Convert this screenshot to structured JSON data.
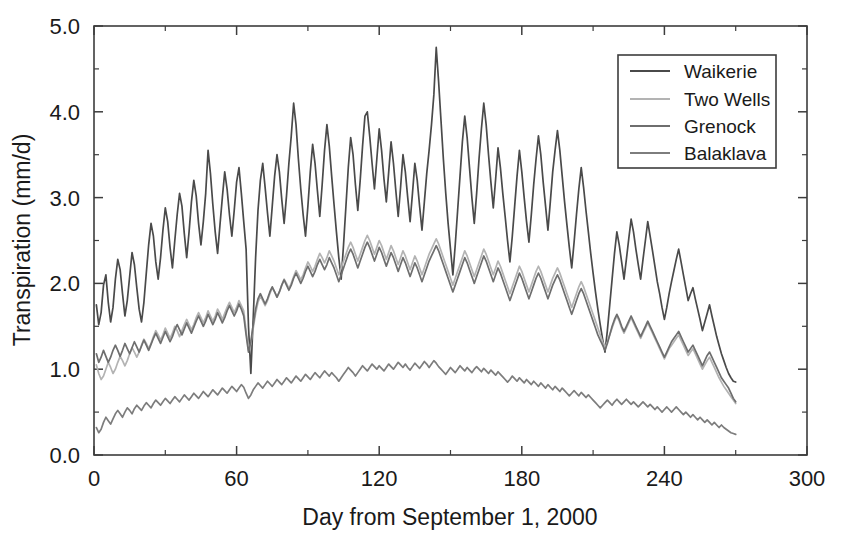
{
  "chart_data": {
    "type": "line",
    "title": "",
    "xlabel": "Day from September 1, 2000",
    "ylabel": "Transpiration (mm/d)",
    "xlim": [
      0,
      300
    ],
    "ylim": [
      0,
      5.0
    ],
    "x_major_ticks": [
      0,
      60,
      120,
      180,
      240,
      300
    ],
    "x_tick_labels": [
      "0",
      "60",
      "120",
      "180",
      "240",
      "300"
    ],
    "x_minor_interval": 30,
    "y_major_ticks": [
      0.0,
      1.0,
      2.0,
      3.0,
      4.0,
      5.0
    ],
    "y_tick_labels": [
      "0.0",
      "1.0",
      "2.0",
      "3.0",
      "4.0",
      "5.0"
    ],
    "y_minor_interval": 0.5,
    "grid": false,
    "legend_position": "top-right",
    "legend_entries": [
      "Waikerie",
      "Two Wells",
      "Grenock",
      "Balaklava"
    ],
    "x_start": 1,
    "x_end": 270,
    "x_step": 1,
    "series": [
      {
        "name": "Waikerie",
        "color": "#4a4a4a",
        "values": [
          1.75,
          1.52,
          1.66,
          1.98,
          2.1,
          1.78,
          1.55,
          1.72,
          2.05,
          2.28,
          2.16,
          1.88,
          1.62,
          1.8,
          2.08,
          2.36,
          2.22,
          1.95,
          1.7,
          1.55,
          1.78,
          2.12,
          2.45,
          2.7,
          2.55,
          2.25,
          2.05,
          2.3,
          2.62,
          2.88,
          2.72,
          2.42,
          2.18,
          2.5,
          2.8,
          3.05,
          2.9,
          2.58,
          2.3,
          2.6,
          2.95,
          3.2,
          3.02,
          2.7,
          2.45,
          2.72,
          3.05,
          3.55,
          3.28,
          2.92,
          2.6,
          2.35,
          2.68,
          3.0,
          3.3,
          3.1,
          2.8,
          2.55,
          2.85,
          3.18,
          3.35,
          3.05,
          2.72,
          2.4,
          1.5,
          0.95,
          1.6,
          2.3,
          2.85,
          3.2,
          3.4,
          3.12,
          2.82,
          2.55,
          2.9,
          3.25,
          3.5,
          3.3,
          2.98,
          2.7,
          3.02,
          3.4,
          3.72,
          4.1,
          3.85,
          3.45,
          3.1,
          2.8,
          2.55,
          2.9,
          3.3,
          3.62,
          3.4,
          3.08,
          2.78,
          3.15,
          3.55,
          3.85,
          3.6,
          3.25,
          2.92,
          2.6,
          2.3,
          2.05,
          2.45,
          2.9,
          3.35,
          3.7,
          3.5,
          3.15,
          2.85,
          3.2,
          3.6,
          3.95,
          4.0,
          3.72,
          3.4,
          3.1,
          3.45,
          3.8,
          3.55,
          3.22,
          2.95,
          3.3,
          3.65,
          3.4,
          3.08,
          2.78,
          3.12,
          3.5,
          3.3,
          3.0,
          2.72,
          3.05,
          3.4,
          3.2,
          2.9,
          2.62,
          2.95,
          3.28,
          3.55,
          3.85,
          4.2,
          4.75,
          4.35,
          3.9,
          3.45,
          3.05,
          2.7,
          2.4,
          2.1,
          2.45,
          2.85,
          3.25,
          3.65,
          3.95,
          3.7,
          3.35,
          3.0,
          2.7,
          3.05,
          3.45,
          3.8,
          4.1,
          3.85,
          3.5,
          3.18,
          2.88,
          3.22,
          3.58,
          3.35,
          3.05,
          2.78,
          2.5,
          2.25,
          2.55,
          2.9,
          3.25,
          3.55,
          3.3,
          3.0,
          2.72,
          2.48,
          2.8,
          3.15,
          3.45,
          3.72,
          3.5,
          3.18,
          2.9,
          2.62,
          2.95,
          3.3,
          3.55,
          3.78,
          3.55,
          3.25,
          2.95,
          2.68,
          2.42,
          2.18,
          2.48,
          2.8,
          3.1,
          3.35,
          3.12,
          2.85,
          2.6,
          2.35,
          2.12,
          1.9,
          1.7,
          1.52,
          1.35,
          1.2,
          1.45,
          1.75,
          2.05,
          2.35,
          2.6,
          2.45,
          2.25,
          2.05,
          2.28,
          2.52,
          2.75,
          2.6,
          2.4,
          2.22,
          2.05,
          2.28,
          2.5,
          2.72,
          2.55,
          2.38,
          2.2,
          2.02,
          1.88,
          1.72,
          1.58,
          1.72,
          1.88,
          2.02,
          2.15,
          2.28,
          2.4,
          2.25,
          2.1,
          1.95,
          1.8,
          1.88,
          1.95,
          1.82,
          1.7,
          1.58,
          1.45,
          1.55,
          1.65,
          1.75,
          1.62,
          1.5,
          1.38,
          1.28,
          1.18,
          1.1,
          1.02,
          0.95,
          0.9,
          0.86,
          0.85
        ]
      },
      {
        "name": "Two Wells",
        "color": "#b3b3b3",
        "values": [
          1.05,
          0.95,
          0.88,
          0.92,
          1.0,
          1.08,
          1.02,
          0.95,
          1.0,
          1.08,
          1.15,
          1.1,
          1.04,
          1.1,
          1.18,
          1.25,
          1.2,
          1.14,
          1.2,
          1.28,
          1.35,
          1.3,
          1.24,
          1.3,
          1.38,
          1.45,
          1.4,
          1.34,
          1.4,
          1.48,
          1.42,
          1.36,
          1.42,
          1.5,
          1.45,
          1.38,
          1.45,
          1.52,
          1.58,
          1.52,
          1.46,
          1.52,
          1.6,
          1.66,
          1.6,
          1.54,
          1.6,
          1.68,
          1.62,
          1.56,
          1.62,
          1.7,
          1.65,
          1.58,
          1.65,
          1.72,
          1.78,
          1.72,
          1.66,
          1.72,
          1.8,
          1.74,
          1.68,
          1.45,
          1.22,
          1.3,
          1.48,
          1.65,
          1.78,
          1.85,
          1.8,
          1.74,
          1.8,
          1.88,
          1.95,
          1.9,
          1.84,
          1.9,
          1.98,
          2.05,
          2.0,
          1.94,
          2.0,
          2.08,
          2.15,
          2.1,
          2.04,
          2.1,
          2.18,
          2.25,
          2.2,
          2.14,
          2.2,
          2.28,
          2.35,
          2.3,
          2.24,
          2.3,
          2.38,
          2.32,
          2.26,
          2.18,
          2.1,
          2.18,
          2.26,
          2.34,
          2.42,
          2.48,
          2.42,
          2.34,
          2.26,
          2.34,
          2.42,
          2.5,
          2.56,
          2.5,
          2.42,
          2.34,
          2.42,
          2.5,
          2.44,
          2.36,
          2.28,
          2.36,
          2.44,
          2.38,
          2.3,
          2.22,
          2.3,
          2.38,
          2.32,
          2.24,
          2.16,
          2.24,
          2.32,
          2.26,
          2.18,
          2.1,
          2.18,
          2.26,
          2.34,
          2.4,
          2.46,
          2.52,
          2.46,
          2.38,
          2.3,
          2.22,
          2.14,
          2.06,
          1.98,
          2.06,
          2.14,
          2.22,
          2.3,
          2.38,
          2.32,
          2.24,
          2.16,
          2.08,
          2.16,
          2.24,
          2.32,
          2.4,
          2.34,
          2.26,
          2.18,
          2.1,
          2.18,
          2.26,
          2.2,
          2.12,
          2.04,
          1.96,
          1.88,
          1.96,
          2.04,
          2.12,
          2.2,
          2.14,
          2.06,
          1.98,
          1.9,
          1.98,
          2.06,
          2.14,
          2.2,
          2.14,
          2.06,
          1.98,
          1.9,
          1.98,
          2.06,
          2.12,
          2.18,
          2.12,
          2.04,
          1.96,
          1.88,
          1.8,
          1.72,
          1.8,
          1.88,
          1.96,
          2.02,
          1.96,
          1.88,
          1.8,
          1.72,
          1.64,
          1.56,
          1.48,
          1.4,
          1.32,
          1.25,
          1.32,
          1.4,
          1.48,
          1.56,
          1.62,
          1.56,
          1.48,
          1.42,
          1.48,
          1.54,
          1.6,
          1.54,
          1.48,
          1.42,
          1.36,
          1.42,
          1.48,
          1.54,
          1.48,
          1.42,
          1.36,
          1.3,
          1.24,
          1.18,
          1.12,
          1.18,
          1.24,
          1.28,
          1.32,
          1.36,
          1.4,
          1.34,
          1.28,
          1.22,
          1.16,
          1.2,
          1.24,
          1.18,
          1.12,
          1.06,
          1.0,
          1.05,
          1.1,
          1.14,
          1.08,
          1.02,
          0.96,
          0.9,
          0.85,
          0.8,
          0.76,
          0.72,
          0.68,
          0.64,
          0.6
        ]
      },
      {
        "name": "Grenock",
        "color": "#6e6e6e",
        "values": [
          1.18,
          1.08,
          1.14,
          1.22,
          1.15,
          1.08,
          1.14,
          1.22,
          1.28,
          1.22,
          1.15,
          1.22,
          1.3,
          1.24,
          1.18,
          1.25,
          1.32,
          1.26,
          1.2,
          1.27,
          1.34,
          1.28,
          1.22,
          1.29,
          1.36,
          1.42,
          1.36,
          1.3,
          1.37,
          1.44,
          1.38,
          1.32,
          1.38,
          1.46,
          1.52,
          1.46,
          1.4,
          1.47,
          1.54,
          1.48,
          1.42,
          1.49,
          1.56,
          1.62,
          1.56,
          1.5,
          1.56,
          1.64,
          1.58,
          1.52,
          1.58,
          1.66,
          1.6,
          1.54,
          1.6,
          1.68,
          1.74,
          1.68,
          1.62,
          1.68,
          1.76,
          1.7,
          1.62,
          1.4,
          1.2,
          1.32,
          1.52,
          1.7,
          1.82,
          1.88,
          1.82,
          1.76,
          1.82,
          1.9,
          1.96,
          1.9,
          1.84,
          1.9,
          1.98,
          2.04,
          1.98,
          1.92,
          1.98,
          2.06,
          2.12,
          2.06,
          2.0,
          2.06,
          2.14,
          2.2,
          2.14,
          2.08,
          2.14,
          2.22,
          2.28,
          2.22,
          2.16,
          2.22,
          2.3,
          2.24,
          2.18,
          2.1,
          2.02,
          2.1,
          2.18,
          2.26,
          2.34,
          2.4,
          2.34,
          2.26,
          2.18,
          2.26,
          2.34,
          2.42,
          2.48,
          2.42,
          2.34,
          2.26,
          2.34,
          2.42,
          2.36,
          2.28,
          2.2,
          2.28,
          2.36,
          2.3,
          2.22,
          2.14,
          2.22,
          2.3,
          2.24,
          2.16,
          2.08,
          2.16,
          2.24,
          2.18,
          2.1,
          2.02,
          2.1,
          2.18,
          2.26,
          2.32,
          2.38,
          2.44,
          2.38,
          2.3,
          2.22,
          2.14,
          2.06,
          1.98,
          1.9,
          1.98,
          2.06,
          2.14,
          2.22,
          2.3,
          2.24,
          2.16,
          2.08,
          2.0,
          2.08,
          2.16,
          2.24,
          2.32,
          2.26,
          2.18,
          2.1,
          2.02,
          2.1,
          2.18,
          2.12,
          2.04,
          1.96,
          1.88,
          1.8,
          1.88,
          1.96,
          2.04,
          2.12,
          2.06,
          1.98,
          1.9,
          1.82,
          1.9,
          1.98,
          2.06,
          2.12,
          2.06,
          1.98,
          1.9,
          1.82,
          1.9,
          1.98,
          2.04,
          2.1,
          2.04,
          1.96,
          1.88,
          1.8,
          1.72,
          1.64,
          1.72,
          1.8,
          1.88,
          1.94,
          1.88,
          1.8,
          1.72,
          1.64,
          1.56,
          1.48,
          1.4,
          1.34,
          1.28,
          1.22,
          1.3,
          1.4,
          1.5,
          1.58,
          1.64,
          1.58,
          1.5,
          1.44,
          1.5,
          1.56,
          1.62,
          1.56,
          1.5,
          1.44,
          1.38,
          1.44,
          1.5,
          1.56,
          1.5,
          1.44,
          1.38,
          1.32,
          1.26,
          1.2,
          1.14,
          1.2,
          1.26,
          1.32,
          1.36,
          1.4,
          1.44,
          1.38,
          1.32,
          1.26,
          1.2,
          1.24,
          1.28,
          1.22,
          1.16,
          1.1,
          1.04,
          1.1,
          1.16,
          1.2,
          1.14,
          1.08,
          1.02,
          0.96,
          0.9,
          0.86,
          0.82,
          0.78,
          0.72,
          0.66,
          0.62
        ]
      },
      {
        "name": "Balaklava",
        "color": "#7d7d7d",
        "values": [
          0.32,
          0.26,
          0.3,
          0.38,
          0.44,
          0.4,
          0.36,
          0.42,
          0.48,
          0.52,
          0.48,
          0.44,
          0.5,
          0.55,
          0.52,
          0.48,
          0.54,
          0.58,
          0.55,
          0.52,
          0.57,
          0.61,
          0.58,
          0.55,
          0.6,
          0.64,
          0.61,
          0.58,
          0.62,
          0.66,
          0.63,
          0.6,
          0.64,
          0.68,
          0.65,
          0.62,
          0.66,
          0.7,
          0.67,
          0.64,
          0.68,
          0.72,
          0.69,
          0.66,
          0.7,
          0.74,
          0.71,
          0.68,
          0.72,
          0.76,
          0.73,
          0.7,
          0.74,
          0.78,
          0.75,
          0.72,
          0.76,
          0.8,
          0.77,
          0.74,
          0.78,
          0.82,
          0.79,
          0.72,
          0.66,
          0.7,
          0.76,
          0.8,
          0.84,
          0.81,
          0.78,
          0.82,
          0.86,
          0.83,
          0.8,
          0.84,
          0.88,
          0.85,
          0.82,
          0.86,
          0.9,
          0.87,
          0.84,
          0.88,
          0.92,
          0.89,
          0.86,
          0.9,
          0.94,
          0.91,
          0.88,
          0.92,
          0.96,
          0.93,
          0.9,
          0.94,
          0.98,
          0.95,
          0.92,
          0.96,
          0.93,
          0.9,
          0.86,
          0.9,
          0.94,
          0.98,
          1.02,
          0.99,
          0.96,
          0.92,
          0.96,
          1.0,
          1.04,
          1.01,
          0.98,
          1.02,
          1.06,
          1.03,
          1.0,
          1.04,
          1.01,
          0.98,
          1.02,
          1.06,
          1.03,
          1.0,
          1.04,
          1.08,
          1.05,
          1.02,
          1.06,
          1.02,
          0.99,
          1.03,
          1.07,
          1.04,
          1.01,
          1.05,
          1.09,
          1.06,
          1.02,
          1.06,
          1.1,
          1.07,
          1.03,
          1.0,
          0.97,
          0.94,
          0.98,
          1.02,
          0.99,
          0.96,
          1.0,
          1.04,
          1.01,
          0.98,
          1.02,
          0.99,
          0.96,
          1.0,
          1.03,
          1.0,
          0.97,
          1.01,
          0.98,
          0.95,
          0.99,
          0.96,
          0.93,
          0.97,
          0.94,
          0.91,
          0.88,
          0.85,
          0.88,
          0.92,
          0.89,
          0.86,
          0.9,
          0.87,
          0.84,
          0.88,
          0.85,
          0.82,
          0.86,
          0.83,
          0.8,
          0.84,
          0.81,
          0.78,
          0.82,
          0.79,
          0.76,
          0.8,
          0.77,
          0.74,
          0.78,
          0.75,
          0.72,
          0.69,
          0.72,
          0.75,
          0.72,
          0.69,
          0.73,
          0.7,
          0.67,
          0.7,
          0.67,
          0.64,
          0.61,
          0.58,
          0.55,
          0.58,
          0.61,
          0.64,
          0.61,
          0.58,
          0.62,
          0.65,
          0.62,
          0.59,
          0.62,
          0.65,
          0.62,
          0.59,
          0.62,
          0.59,
          0.56,
          0.59,
          0.62,
          0.59,
          0.56,
          0.59,
          0.56,
          0.53,
          0.56,
          0.53,
          0.5,
          0.53,
          0.56,
          0.53,
          0.5,
          0.53,
          0.56,
          0.53,
          0.5,
          0.47,
          0.5,
          0.47,
          0.44,
          0.47,
          0.44,
          0.41,
          0.44,
          0.41,
          0.38,
          0.41,
          0.38,
          0.35,
          0.38,
          0.35,
          0.32,
          0.35,
          0.32,
          0.3,
          0.28,
          0.26,
          0.25,
          0.24
        ]
      }
    ]
  }
}
